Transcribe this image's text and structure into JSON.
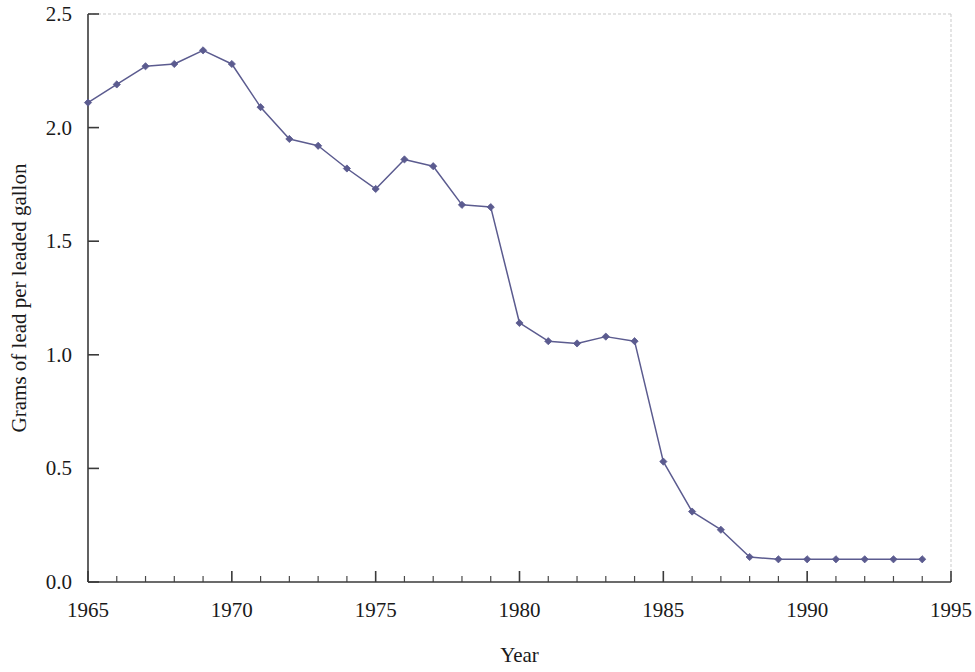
{
  "chart_data": {
    "type": "line",
    "title": "",
    "subtitle": "",
    "xlabel": "Year",
    "ylabel": "Grams of lead per leaded gallon",
    "xlim": [
      1965,
      1995
    ],
    "ylim": [
      0.0,
      2.5
    ],
    "grid": false,
    "legend": false,
    "legend_position": "none",
    "x_tick_labels": [
      "1965",
      "1970",
      "1975",
      "1980",
      "1985",
      "1990",
      "1995"
    ],
    "x_major_ticks": [
      1965,
      1970,
      1975,
      1980,
      1985,
      1990,
      1995
    ],
    "x_minor_tick_interval": 1,
    "y_tick_labels": [
      "0.0",
      "0.5",
      "1.0",
      "1.5",
      "2.0",
      "2.5"
    ],
    "y_major_ticks": [
      0.0,
      0.5,
      1.0,
      1.5,
      2.0,
      2.5
    ],
    "x": [
      1965,
      1966,
      1967,
      1968,
      1969,
      1970,
      1971,
      1972,
      1973,
      1974,
      1975,
      1976,
      1977,
      1978,
      1979,
      1980,
      1981,
      1982,
      1983,
      1984,
      1985,
      1986,
      1987,
      1988,
      1989,
      1990,
      1991,
      1992,
      1993,
      1994
    ],
    "series": [
      {
        "name": "Grams of lead per leaded gallon",
        "color": "#5b5b8f",
        "marker": "diamond",
        "values": [
          2.11,
          2.19,
          2.27,
          2.28,
          2.34,
          2.28,
          2.09,
          1.95,
          1.92,
          1.82,
          1.73,
          1.86,
          1.83,
          1.66,
          1.65,
          1.14,
          1.06,
          1.05,
          1.08,
          1.06,
          0.53,
          0.31,
          0.23,
          0.11,
          0.1,
          0.1,
          0.1,
          0.1,
          0.1,
          0.1
        ]
      }
    ],
    "annotations": [],
    "colors": {
      "series": "#5b5b8f",
      "axis": "#3a3a3a",
      "frame": "#c9c9c9",
      "text": "#1a1a1a",
      "background": "#ffffff"
    }
  }
}
